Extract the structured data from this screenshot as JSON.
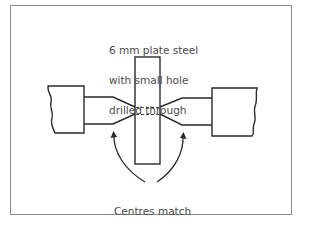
{
  "diagram": {
    "title_label": {
      "lines": [
        "6 mm plate steel",
        "with small hole",
        "drilled through"
      ]
    },
    "bottom_label": {
      "lines": [
        "Centres match",
        "up with hole"
      ]
    },
    "caption_clipped": "Fig. 5.4 — cut off at bottom edge",
    "components": {
      "left_chuck": "left-lathe-centre",
      "right_chuck": "right-lathe-centre",
      "plate": "steel-plate",
      "hole": "drilled-hole-dashed",
      "arrows": [
        "left-arrow-to-left-centre-point",
        "right-arrow-to-right-centre-point"
      ]
    },
    "colors": {
      "line": "#2a2a2a",
      "frame": "#8a8a8a",
      "text": "#4a4a4a"
    }
  }
}
